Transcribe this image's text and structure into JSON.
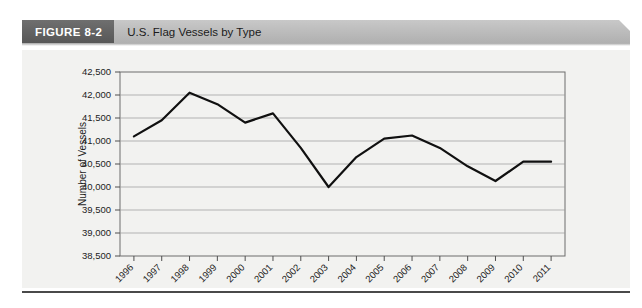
{
  "figure": {
    "number_label": "FIGURE 8-2",
    "title": "U.S. Flag Vessels by Type"
  },
  "colors": {
    "figure_number_bg": "#636363",
    "figure_bar_bg": "#bdbdbd",
    "plot_bg": "#f2f2f0",
    "line": "#101010",
    "gridline": "#9a9a9a",
    "frame": "#6d6d6d",
    "rule": "#4a4a4a"
  },
  "chart_data": {
    "type": "line",
    "title": "U.S. Flag Vessels by Type",
    "xlabel": "",
    "ylabel": "Number of Vessels",
    "grid": true,
    "legend": false,
    "ylim": [
      38500,
      42500
    ],
    "ytick_labels": [
      "42,500",
      "42,000",
      "41,500",
      "41,000",
      "40,500",
      "40,000",
      "39,500",
      "39,000",
      "38,500"
    ],
    "yticks": [
      42500,
      42000,
      41500,
      41000,
      40500,
      40000,
      39500,
      39000,
      38500
    ],
    "categories": [
      "1996",
      "1997",
      "1998",
      "1999",
      "2000",
      "2001",
      "2002",
      "2003",
      "2004",
      "2005",
      "2006",
      "2007",
      "2008",
      "2009",
      "2010",
      "2011"
    ],
    "values": [
      41100,
      41450,
      42050,
      41800,
      41400,
      41600,
      40850,
      40000,
      40650,
      41050,
      41120,
      40850,
      40450,
      40130,
      40550,
      40550
    ]
  }
}
